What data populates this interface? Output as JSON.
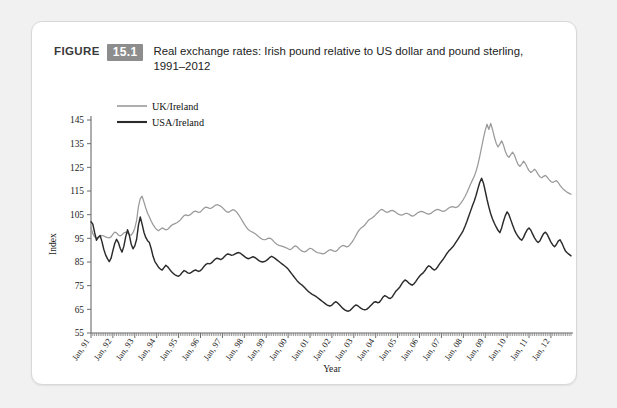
{
  "caption": {
    "figure_word": "FIGURE",
    "number": "15.1",
    "text": "Real exchange rates: Irish pound relative to US dollar and pound sterling, 1991–2012"
  },
  "colors": {
    "card_background": "#ffffff",
    "page_background": "#f1f1f1",
    "badge": "#8d8d8d",
    "uk_series": "#9a9a9a",
    "usa_series": "#2b2b2b",
    "axis": "#6b6b6b"
  },
  "chart_data": {
    "type": "line",
    "title": "Real exchange rates: Irish pound relative to US dollar and pound sterling, 1991–2012",
    "xlabel": "Year",
    "ylabel": "Index",
    "ylim": [
      55,
      145
    ],
    "ytick_labels": [
      "145",
      "135",
      "125",
      "115",
      "105",
      "95",
      "85",
      "75",
      "65",
      "55"
    ],
    "yticks": [
      145,
      135,
      125,
      115,
      105,
      95,
      85,
      75,
      65,
      55
    ],
    "grid": false,
    "legend_position": "top-left",
    "x_start": "Jan, 91",
    "x_end": "Dec, 12",
    "x_frequency": "monthly",
    "xtick_labels": [
      "Jan, 91",
      "Jan, 92",
      "Jan, 93",
      "Jan, 94",
      "Jan, 95",
      "Jan, 96",
      "Jan, 97",
      "Jan, 98",
      "Jan, 99",
      "Jan, 00",
      "Jan, 01",
      "Jan, 02",
      "Jan, 03",
      "Jan, 04",
      "Jan, 05",
      "Jan, 06",
      "Jan, 07",
      "Jan, 08",
      "Jan, 09",
      "Jan, 10",
      "Jan, 11",
      "Jan, 12"
    ],
    "series": [
      {
        "name": "UK/Ireland",
        "color": "#9a9a9a",
        "values": [
          99.5,
          97.0,
          95.6,
          95.2,
          95.5,
          96.0,
          96.2,
          96.0,
          95.6,
          95.3,
          95.2,
          95.6,
          96.8,
          97.6,
          97.3,
          96.4,
          96.0,
          96.5,
          97.3,
          97.6,
          97.2,
          96.5,
          96.4,
          97.4,
          99.3,
          102.6,
          108.5,
          111.8,
          112.8,
          110.4,
          107.8,
          105.6,
          104.0,
          102.2,
          100.8,
          99.6,
          98.7,
          98.2,
          98.8,
          99.4,
          99.0,
          98.6,
          98.8,
          99.6,
          100.4,
          100.9,
          101.2,
          101.6,
          102.1,
          102.8,
          103.8,
          104.6,
          104.9,
          104.6,
          104.8,
          105.4,
          106.1,
          106.5,
          106.3,
          105.9,
          106.2,
          107.0,
          107.8,
          108.2,
          108.0,
          107.6,
          107.8,
          108.3,
          108.9,
          109.2,
          109.0,
          108.6,
          108.0,
          107.2,
          106.4,
          106.0,
          106.3,
          106.8,
          107.1,
          106.7,
          105.9,
          104.8,
          103.6,
          102.3,
          101.0,
          99.8,
          98.8,
          98.2,
          97.8,
          97.4,
          96.9,
          96.3,
          95.6,
          95.0,
          94.6,
          94.4,
          94.6,
          95.0,
          95.1,
          94.6,
          93.8,
          93.0,
          92.4,
          92.0,
          91.8,
          91.6,
          91.3,
          91.0,
          90.6,
          90.2,
          90.6,
          91.4,
          91.8,
          91.4,
          90.6,
          89.9,
          89.5,
          89.3,
          89.6,
          90.3,
          90.8,
          90.6,
          90.0,
          89.4,
          89.0,
          88.8,
          88.6,
          88.4,
          88.6,
          89.2,
          89.8,
          90.2,
          90.0,
          89.6,
          89.5,
          90.0,
          90.9,
          91.6,
          92.0,
          91.8,
          91.4,
          91.6,
          92.4,
          93.4,
          94.6,
          96.0,
          97.4,
          98.6,
          99.4,
          99.9,
          100.6,
          101.6,
          102.6,
          103.2,
          103.6,
          104.2,
          105.0,
          105.8,
          106.6,
          107.2,
          107.0,
          106.4,
          106.0,
          106.2,
          106.6,
          106.8,
          106.5,
          106.0,
          105.4,
          105.0,
          104.8,
          105.0,
          105.4,
          105.6,
          105.3,
          104.8,
          104.4,
          104.6,
          105.2,
          105.8,
          106.2,
          106.4,
          106.2,
          105.8,
          105.4,
          105.2,
          105.4,
          106.0,
          106.6,
          107.0,
          107.2,
          107.0,
          106.6,
          106.4,
          106.6,
          107.2,
          107.8,
          108.2,
          108.4,
          108.2,
          108.0,
          108.4,
          109.2,
          110.2,
          111.4,
          112.8,
          114.4,
          116.2,
          118.0,
          119.6,
          121.2,
          123.4,
          126.2,
          129.6,
          133.4,
          137.2,
          140.6,
          143.2,
          141.0,
          143.6,
          141.0,
          137.8,
          135.2,
          133.6,
          134.8,
          136.2,
          134.4,
          131.8,
          130.0,
          129.2,
          130.4,
          131.4,
          130.2,
          128.0,
          126.2,
          125.4,
          126.4,
          127.6,
          126.6,
          125.0,
          123.6,
          122.8,
          123.4,
          124.2,
          123.4,
          122.0,
          121.0,
          120.6,
          121.2,
          121.6,
          120.8,
          119.8,
          119.0,
          118.6,
          119.0,
          119.4,
          118.6,
          117.4,
          116.4,
          115.6,
          115.0,
          114.4,
          114.0,
          113.6
        ]
      },
      {
        "name": "USA/Ireland",
        "color": "#2b2b2b",
        "values": [
          102.0,
          101.0,
          97.4,
          94.2,
          95.4,
          96.2,
          93.6,
          90.4,
          88.0,
          86.4,
          85.2,
          86.6,
          89.8,
          92.8,
          94.6,
          93.2,
          90.8,
          89.2,
          91.6,
          95.6,
          98.6,
          96.4,
          92.6,
          90.6,
          91.8,
          94.6,
          100.6,
          104.0,
          101.0,
          97.6,
          95.4,
          94.0,
          93.2,
          90.6,
          87.4,
          85.2,
          84.0,
          82.8,
          82.0,
          81.6,
          82.6,
          83.6,
          83.0,
          82.0,
          81.0,
          80.2,
          79.6,
          79.2,
          79.0,
          79.6,
          80.6,
          81.4,
          81.0,
          80.4,
          80.2,
          80.6,
          81.2,
          81.6,
          81.4,
          81.0,
          81.4,
          82.2,
          83.2,
          84.0,
          84.4,
          84.2,
          84.6,
          85.4,
          86.2,
          86.6,
          86.4,
          86.0,
          86.4,
          87.2,
          88.0,
          88.4,
          88.2,
          87.8,
          88.0,
          88.4,
          88.8,
          89.0,
          88.6,
          88.0,
          87.4,
          86.8,
          86.4,
          86.6,
          87.0,
          87.2,
          86.8,
          86.2,
          85.6,
          85.2,
          85.0,
          85.2,
          85.6,
          86.2,
          87.0,
          87.4,
          87.0,
          86.4,
          85.8,
          85.2,
          84.6,
          84.0,
          83.4,
          82.8,
          82.0,
          81.0,
          80.0,
          79.0,
          78.0,
          77.0,
          76.2,
          75.6,
          75.0,
          74.2,
          73.4,
          72.6,
          72.0,
          71.4,
          71.0,
          70.6,
          70.0,
          69.4,
          68.8,
          68.2,
          67.6,
          67.0,
          66.6,
          66.4,
          66.8,
          67.6,
          68.2,
          67.8,
          67.0,
          66.2,
          65.4,
          64.8,
          64.4,
          64.2,
          64.6,
          65.4,
          66.2,
          66.8,
          66.6,
          66.0,
          65.4,
          65.0,
          64.8,
          65.0,
          65.6,
          66.4,
          67.2,
          68.0,
          68.2,
          67.8,
          68.0,
          69.0,
          70.2,
          70.8,
          70.4,
          69.8,
          69.6,
          70.2,
          71.4,
          72.6,
          73.4,
          74.2,
          75.4,
          76.6,
          77.4,
          77.0,
          76.2,
          75.6,
          75.2,
          75.8,
          76.8,
          78.0,
          79.0,
          79.8,
          80.4,
          81.4,
          82.6,
          83.4,
          83.0,
          82.2,
          81.6,
          82.0,
          83.0,
          84.2,
          85.2,
          86.2,
          87.4,
          88.6,
          89.6,
          90.4,
          91.2,
          92.2,
          93.4,
          94.6,
          95.8,
          97.0,
          98.4,
          100.2,
          102.2,
          104.4,
          106.6,
          108.8,
          110.8,
          113.2,
          116.0,
          118.6,
          120.4,
          118.4,
          115.0,
          111.4,
          108.2,
          105.4,
          103.2,
          101.4,
          99.8,
          98.4,
          97.4,
          99.4,
          102.2,
          104.6,
          106.2,
          105.0,
          102.8,
          100.6,
          98.6,
          97.0,
          95.8,
          94.8,
          94.2,
          95.4,
          97.2,
          98.6,
          99.4,
          98.4,
          96.8,
          95.2,
          94.0,
          93.2,
          94.0,
          95.6,
          97.0,
          97.6,
          96.6,
          95.0,
          93.4,
          92.2,
          91.4,
          92.4,
          93.8,
          94.4,
          93.0,
          91.2,
          89.6,
          88.8,
          88.2,
          87.6
        ]
      }
    ]
  }
}
